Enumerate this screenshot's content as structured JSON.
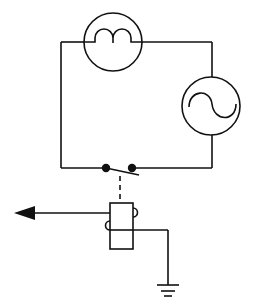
{
  "diagram": {
    "type": "circuit schematic",
    "background": "#ffffff",
    "stroke_color": "#111111",
    "components": [
      {
        "id": "lamp",
        "symbol": "lamp-filament-icon",
        "label": "Lamp"
      },
      {
        "id": "ac_source",
        "symbol": "ac-source-icon",
        "label": "AC source"
      },
      {
        "id": "switch",
        "symbol": "switch-icon",
        "label": "Switch (normally open contacts)"
      },
      {
        "id": "relay",
        "symbol": "relay-coil-icon",
        "label": "Relay / actuator"
      },
      {
        "id": "output_arrow",
        "symbol": "arrow-left-icon",
        "label": "Output"
      },
      {
        "id": "ground",
        "symbol": "ground-icon",
        "label": "Ground"
      }
    ],
    "connections": [
      "lamp -> ac_source (top loop)",
      "ac_source -> switch (bottom loop)",
      "switch -> lamp (left side)",
      "switch - - relay (mechanical link, dashed)",
      "relay -> output_arrow",
      "relay -> ground"
    ]
  }
}
